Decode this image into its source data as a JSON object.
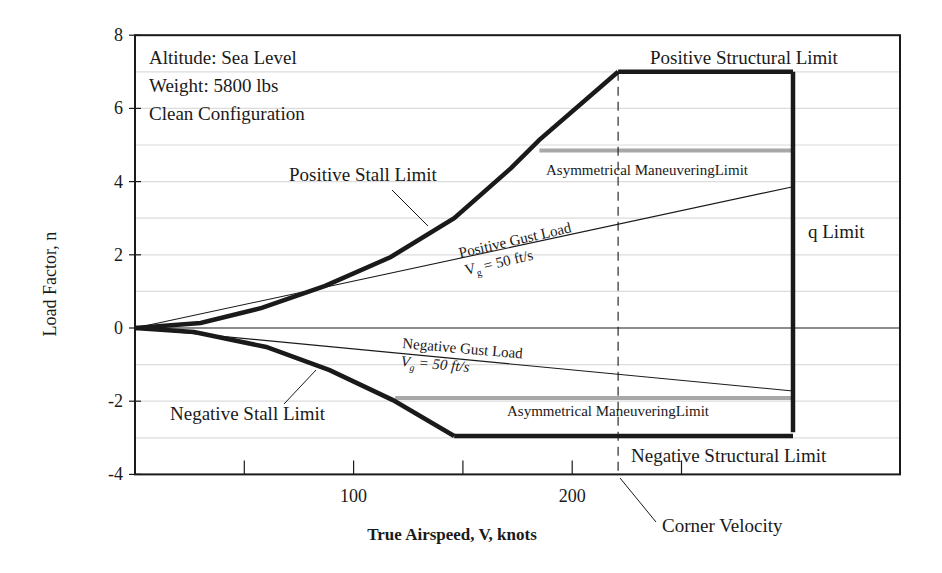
{
  "chart_data": {
    "type": "line",
    "xlabel": "True Airspeed, V, knots",
    "ylabel": "Load Factor, n",
    "xlim": [
      0,
      350
    ],
    "ylim": [
      -4,
      8
    ],
    "x_ticks": [
      50,
      100,
      150,
      200,
      250
    ],
    "x_tick_labels": [
      {
        "value": 100,
        "label": "100"
      },
      {
        "value": 200,
        "label": "200"
      }
    ],
    "y_ticks": [
      -4,
      -2,
      0,
      2,
      4,
      6,
      8
    ],
    "y_tick_labels": [
      "-4",
      "-2",
      "0",
      "2",
      "4",
      "6",
      "8"
    ],
    "grid": {
      "horizontal": true,
      "every": 1,
      "color": "#dcdcdc"
    },
    "conditions": [
      "Altitude:  Sea Level",
      "Weight: 5800 lbs",
      "Clean Configuration"
    ],
    "series": [
      {
        "name": "Positive Stall Limit",
        "style": "heavy",
        "points": [
          [
            0,
            0
          ],
          [
            30,
            0.14
          ],
          [
            58,
            0.55
          ],
          [
            87,
            1.15
          ],
          [
            117,
            1.94
          ],
          [
            146,
            3.0
          ],
          [
            172,
            4.37
          ],
          [
            185,
            5.14
          ],
          [
            221,
            7.0
          ]
        ]
      },
      {
        "name": "Positive Structural Limit",
        "style": "heavy",
        "points": [
          [
            221,
            7.0
          ],
          [
            301,
            7.0
          ]
        ]
      },
      {
        "name": "q Limit",
        "style": "heavy",
        "points": [
          [
            301,
            7.0
          ],
          [
            301,
            -2.85
          ]
        ]
      },
      {
        "name": "Negative Structural Limit",
        "style": "heavy",
        "points": [
          [
            146,
            -2.95
          ],
          [
            301,
            -2.95
          ]
        ]
      },
      {
        "name": "Negative Stall Limit",
        "style": "heavy",
        "points": [
          [
            0,
            0
          ],
          [
            27,
            -0.11
          ],
          [
            60,
            -0.52
          ],
          [
            89,
            -1.15
          ],
          [
            118,
            -1.97
          ],
          [
            146,
            -2.95
          ]
        ]
      },
      {
        "name": "Positive Gust Load (Vg = 50 ft/s)",
        "style": "thin",
        "points": [
          [
            0,
            0
          ],
          [
            301,
            3.86
          ]
        ]
      },
      {
        "name": "Negative Gust Load (Vg = 50 ft/s)",
        "style": "thin",
        "points": [
          [
            0,
            0
          ],
          [
            301,
            -1.72
          ]
        ]
      },
      {
        "name": "Asymmetrical Maneuvering Limit (positive)",
        "style": "gray",
        "points": [
          [
            185,
            4.85
          ],
          [
            301,
            4.85
          ]
        ]
      },
      {
        "name": "Asymmetrical Maneuvering Limit (negative)",
        "style": "gray",
        "points": [
          [
            119,
            -1.91
          ],
          [
            301,
            -1.91
          ]
        ]
      },
      {
        "name": "Zero Load Line",
        "style": "thin",
        "points": [
          [
            0,
            0
          ],
          [
            350,
            0
          ]
        ]
      },
      {
        "name": "Corner Velocity",
        "style": "dashed",
        "points": [
          [
            221,
            7.0
          ],
          [
            221,
            -4.0
          ]
        ]
      }
    ],
    "annotations": {
      "positive_stall": "Positive Stall Limit",
      "negative_stall": "Negative Stall Limit",
      "positive_structural": "Positive Structural Limit",
      "negative_structural": "Negative Structural Limit",
      "q_limit": "q Limit",
      "asym_pos": "Asymmetrical ManeuveringLimit",
      "asym_neg": "Asymmetrical ManeuveringLimit",
      "pos_gust": "Positive Gust Load",
      "neg_gust": "Negative Gust Load",
      "gust_speed_prefix": "V",
      "gust_speed_sub": "g",
      "gust_speed_suffix": " = 50 ft/s",
      "corner_velocity": "Corner Velocity"
    },
    "colors": {
      "line": "#1a1a1a",
      "gray_limit": "#a8a8a8",
      "grid": "#dcdcdc"
    }
  }
}
